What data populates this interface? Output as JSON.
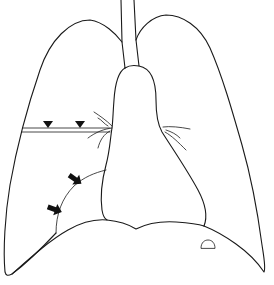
{
  "diagram": {
    "type": "chest-radiograph-schematic",
    "view": "frontal",
    "structures": [
      {
        "id": "trachea",
        "label": "trachea"
      },
      {
        "id": "right-lung",
        "label": "right lung (image left)"
      },
      {
        "id": "left-lung",
        "label": "left lung (image right)"
      },
      {
        "id": "mediastinum",
        "label": "heart / mediastinum"
      },
      {
        "id": "horizontal-fissure",
        "label": "thickened horizontal fissure"
      },
      {
        "id": "hilar-vessels",
        "label": "hilar vessels"
      },
      {
        "id": "middle-lobe-opacity",
        "label": "curved opacity border"
      },
      {
        "id": "diaphragm",
        "label": "diaphragm"
      },
      {
        "id": "gastric-bubble",
        "label": "gastric air bubble"
      }
    ],
    "markers": {
      "arrowheads": {
        "count": 2,
        "shape": "triangle-down",
        "target": "horizontal-fissure",
        "color": "#111111"
      },
      "arrows": {
        "count": 2,
        "shape": "block-arrow",
        "target": "middle-lobe-opacity",
        "color": "#111111"
      }
    },
    "colors": {
      "background": "#ffffff",
      "line": "#1a1a1a"
    }
  }
}
